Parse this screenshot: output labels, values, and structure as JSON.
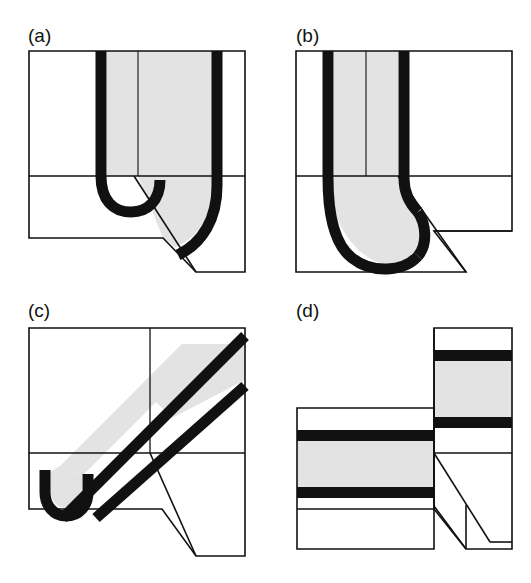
{
  "figure": {
    "type": "technical-line-drawing",
    "background_color": "#ffffff",
    "line_color": "#111111",
    "fill_shaded": "#e3e3e3",
    "fill_solid": "#111111",
    "panel_count": 4
  },
  "panels": [
    {
      "id": "a",
      "label": "(a)",
      "label_x": 28,
      "label_y": 42,
      "geometry": "vertical U-shaped tube descending into block, rounded bottom, front face diagonally cut away",
      "box": {
        "x": 29,
        "y": 51,
        "width": 216,
        "height": 187
      },
      "midline_y": 176
    },
    {
      "id": "b",
      "label": "(b)",
      "label_x": 296,
      "label_y": 42,
      "geometry": "vertical tube bending into a J-curve toward lower left, rounded tip",
      "box": {
        "x": 296,
        "y": 51,
        "width": 216,
        "height": 187
      },
      "midline_y": 176
    },
    {
      "id": "c",
      "label": "(c)",
      "label_x": 28,
      "label_y": 317,
      "geometry": "inclined diagonal tube running upper-right to lower-left, terminating in a short vertical rounded tip",
      "box": {
        "x": 29,
        "y": 328,
        "width": 216,
        "height": 187
      },
      "midline_y": 453
    },
    {
      "id": "d",
      "label": "(d)",
      "label_x": 296,
      "label_y": 317,
      "geometry": "two offset horizontal stratified layers stepped across a vertical fault",
      "box": {
        "x": 296,
        "y": 328,
        "width": 216,
        "height": 187
      },
      "midline_y": 453
    }
  ],
  "labels": {
    "a": "(a)",
    "b": "(b)",
    "c": "(c)",
    "d": "(d)"
  }
}
